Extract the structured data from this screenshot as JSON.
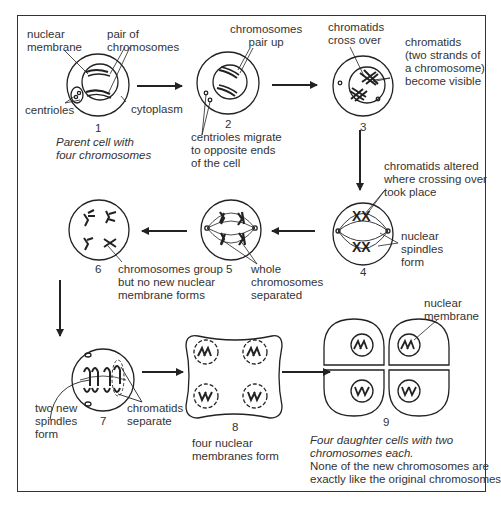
{
  "diagram": {
    "stages": [
      {
        "number": "1",
        "caption": "Parent cell with\nfour chromosomes"
      },
      {
        "number": "2"
      },
      {
        "number": "3"
      },
      {
        "number": "4"
      },
      {
        "number": "5"
      },
      {
        "number": "6"
      },
      {
        "number": "7"
      },
      {
        "number": "8"
      },
      {
        "number": "9",
        "caption": "Four daughter cells with two\nchromosomes each.",
        "note": "None of the new chromosomes are\nexactly like the original chromosomes"
      }
    ],
    "labels": {
      "nuclear_membrane": "nuclear\nmembrane",
      "pair_of_chromosomes": "pair of\nchromosomes",
      "centrioles": "centrioles",
      "cytoplasm": "cytoplasm",
      "chromosomes_pair_up": "chromosomes\npair up",
      "centrioles_migrate": "centrioles migrate\nto opposite ends\nof the cell",
      "chromatids_cross_over": "chromatids\ncross over",
      "chromatids_visible": "chromatids\n(two strands of\na chromosome)\nbecome visible",
      "chromatids_altered": "chromatids altered\nwhere crossing over\ntook place",
      "nuclear_spindles": "nuclear\nspindles\nform",
      "whole_chromosomes": "whole\nchromosomes\nseparated",
      "chromosomes_group": "chromosomes group\nbut no new nuclear\nmembrane forms",
      "two_new_spindles": "two new\nspindles\nform",
      "chromatids_separate": "chromatids\nseparate",
      "four_nuclear_membranes": "four nuclear\nmembranes form",
      "nuclear_membrane_9": "nuclear\nmembrane"
    }
  }
}
